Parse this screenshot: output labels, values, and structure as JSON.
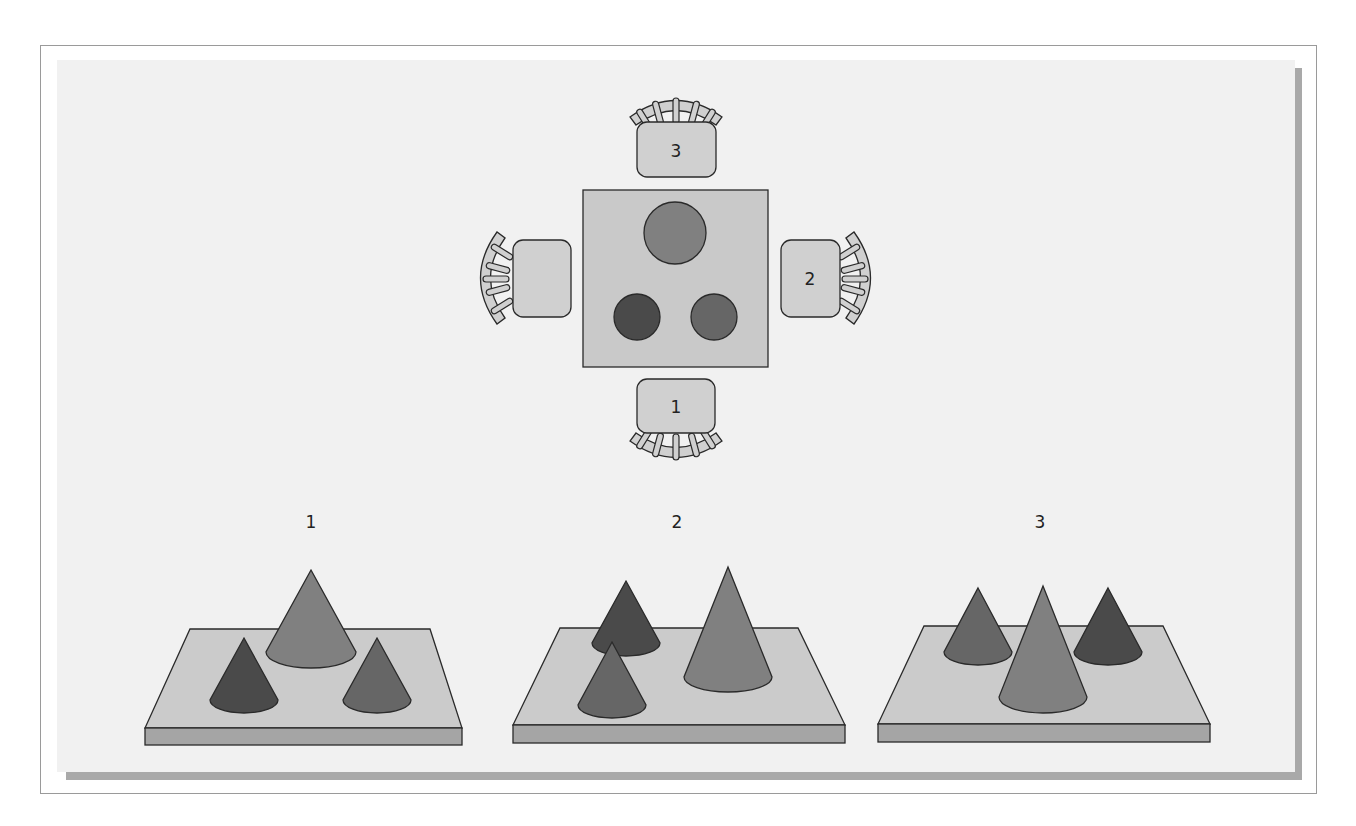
{
  "colors": {
    "background": "#ffffff",
    "frame_border": "#9a9a9a",
    "panel_fill": "#f1f1f1",
    "panel_shadow": "#a9a9a9",
    "table_fill": "#c9c9c9",
    "chair_fill": "#d0d0d0",
    "outline": "#2a2a2a",
    "cone_large": "#808080",
    "cone_dark": "#4a4a4a",
    "cone_medium": "#666666",
    "board_top": "#cbcbcb",
    "board_front": "#a5a5a5"
  },
  "top_view": {
    "chairs": [
      {
        "label": "3",
        "position": "top"
      },
      {
        "label": "2",
        "position": "right"
      },
      {
        "label": "1",
        "position": "bottom"
      },
      {
        "label": "",
        "position": "left"
      }
    ],
    "mountains": [
      "large",
      "dark",
      "medium"
    ]
  },
  "views": [
    {
      "label": "1",
      "cones": [
        "large-back-center",
        "dark-front-left",
        "medium-front-right"
      ]
    },
    {
      "label": "2",
      "cones": [
        "dark-back-left",
        "medium-front-left",
        "large-right"
      ]
    },
    {
      "label": "3",
      "cones": [
        "medium-back-left",
        "dark-back-right",
        "large-front-center"
      ]
    }
  ]
}
